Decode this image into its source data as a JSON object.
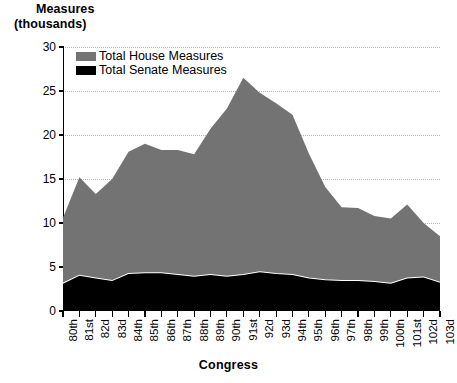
{
  "axis": {
    "ylabel_line1": "Measures",
    "ylabel_line2": "(thousands)",
    "xlabel": "Congress",
    "yticks": [
      "0",
      "5",
      "10",
      "15",
      "20",
      "25",
      "30"
    ]
  },
  "legend": {
    "items": [
      {
        "label": "Total House Measures",
        "color": "#737373"
      },
      {
        "label": "Total Senate Measures",
        "color": "#000000"
      }
    ]
  },
  "colors": {
    "house": "#737373",
    "senate": "#000000",
    "separator": "#ffffff",
    "grid": "#b4b4b4",
    "axis": "#000000",
    "background": "#ffffff"
  },
  "chart_data": {
    "type": "area",
    "title": "",
    "subtitle": "",
    "xlabel": "Congress",
    "ylabel": "Measures (thousands)",
    "ylim": [
      0,
      30
    ],
    "ytick_values": [
      0,
      5,
      10,
      15,
      20,
      25,
      30
    ],
    "grid": true,
    "stacked": true,
    "legend_position": "top-left-inside",
    "categories": [
      "80th",
      "81st",
      "82d",
      "83d",
      "84th",
      "85th",
      "86th",
      "87th",
      "88th",
      "89th",
      "90th",
      "91st",
      "92d",
      "93d",
      "94th",
      "95th",
      "96th",
      "97th",
      "98th",
      "99th",
      "100th",
      "101st",
      "102d",
      "103d"
    ],
    "series": [
      {
        "name": "Total Senate Measures",
        "color": "#000000",
        "values": [
          3.1,
          4.0,
          3.7,
          3.4,
          4.2,
          4.3,
          4.3,
          4.1,
          3.9,
          4.1,
          3.9,
          4.1,
          4.4,
          4.2,
          4.1,
          3.7,
          3.5,
          3.4,
          3.4,
          3.3,
          3.1,
          3.7,
          3.8,
          3.2
        ]
      },
      {
        "name": "Total House Measures",
        "color": "#737373",
        "values": [
          7.5,
          11.2,
          9.6,
          11.6,
          13.9,
          14.7,
          14.0,
          14.2,
          13.9,
          16.6,
          19.1,
          22.4,
          20.4,
          19.4,
          18.2,
          14.2,
          10.6,
          8.4,
          8.3,
          7.5,
          7.4,
          8.4,
          6.2,
          5.3
        ]
      }
    ],
    "totals": [
      10.6,
      15.2,
      13.3,
      15.0,
      18.1,
      19.0,
      18.3,
      18.3,
      17.8,
      20.7,
      23.0,
      26.5,
      24.8,
      23.6,
      22.3,
      17.9,
      14.1,
      11.8,
      11.7,
      10.8,
      10.5,
      12.1,
      10.0,
      8.5
    ]
  }
}
